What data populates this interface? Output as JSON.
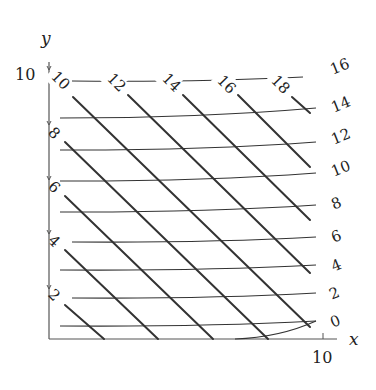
{
  "diagram": {
    "axes": {
      "x_label": "x",
      "y_label": "y",
      "x_max_label": "10",
      "y_max_label": "10",
      "origin": [
        49,
        339
      ],
      "x_end": 337,
      "y_end": 62,
      "x_tick_px": 323,
      "y_tick_px": 70
    },
    "curve_family": {
      "description": "nearly horizontal curves labeled on the right",
      "curves": [
        {
          "label": "16",
          "start": [
            72,
            81
          ],
          "end": [
            303,
            77
          ],
          "label_pos": [
            331,
            70
          ]
        },
        {
          "label": "14",
          "start": [
            60,
            118
          ],
          "end": [
            316,
            108
          ],
          "label_pos": [
            332,
            108
          ]
        },
        {
          "label": "12",
          "start": [
            60,
            150
          ],
          "end": [
            316,
            142
          ],
          "label_pos": [
            332,
            140
          ]
        },
        {
          "label": "10",
          "start": [
            60,
            181
          ],
          "end": [
            316,
            173
          ],
          "label_pos": [
            332,
            172
          ]
        },
        {
          "label": "8",
          "start": [
            60,
            212
          ],
          "end": [
            316,
            205
          ],
          "label_pos": [
            332,
            205
          ]
        },
        {
          "label": "6",
          "start": [
            72,
            242
          ],
          "end": [
            316,
            237
          ],
          "label_pos": [
            332,
            238
          ]
        },
        {
          "label": "4",
          "start": [
            60,
            270
          ],
          "end": [
            316,
            265
          ],
          "label_pos": [
            332,
            267
          ]
        },
        {
          "label": "2",
          "start": [
            72,
            298
          ],
          "end": [
            316,
            293
          ],
          "label_pos": [
            330,
            295
          ]
        },
        {
          "label": "0",
          "start": [
            60,
            326
          ],
          "end": [
            316,
            321
          ],
          "label_pos": [
            331,
            323
          ]
        },
        {
          "label": "",
          "start": [
            235,
            339
          ],
          "end": [
            316,
            321
          ],
          "label_pos": null
        }
      ]
    },
    "line_family": {
      "description": "diagonal straight lines labeled on the top and left",
      "lines": [
        {
          "label": "10",
          "start": [
            73,
            97
          ],
          "end": [
            310,
            327
          ],
          "label_pos": [
            58,
            78
          ],
          "edge": "top"
        },
        {
          "label": "12",
          "start": [
            128,
            95
          ],
          "end": [
            310,
            273
          ],
          "label_pos": [
            114,
            80
          ],
          "edge": "top"
        },
        {
          "label": "14",
          "start": [
            183,
            95
          ],
          "end": [
            310,
            220
          ],
          "label_pos": [
            169,
            80
          ],
          "edge": "top"
        },
        {
          "label": "16",
          "start": [
            238,
            95
          ],
          "end": [
            310,
            167
          ],
          "label_pos": [
            224,
            82
          ],
          "edge": "top"
        },
        {
          "label": "18",
          "start": [
            292,
            97
          ],
          "end": [
            310,
            113
          ],
          "label_pos": [
            278,
            82
          ],
          "edge": "top"
        },
        {
          "label": "8",
          "start": [
            65,
            142
          ],
          "end": [
            268,
            339
          ],
          "label_pos": [
            55,
            134
          ],
          "edge": "left"
        },
        {
          "label": "6",
          "start": [
            65,
            196
          ],
          "end": [
            213,
            339
          ],
          "label_pos": [
            55,
            188
          ],
          "edge": "left"
        },
        {
          "label": "4",
          "start": [
            65,
            250
          ],
          "end": [
            158,
            339
          ],
          "label_pos": [
            55,
            242
          ],
          "edge": "left"
        },
        {
          "label": "2",
          "start": [
            65,
            305
          ],
          "end": [
            104,
            339
          ],
          "label_pos": [
            55,
            296
          ],
          "edge": "left"
        }
      ]
    },
    "left_ticks_px": [
      125,
      180,
      234,
      289
    ],
    "colors": {
      "line": "#333333",
      "axis": "#555555",
      "background": "#ffffff"
    }
  }
}
